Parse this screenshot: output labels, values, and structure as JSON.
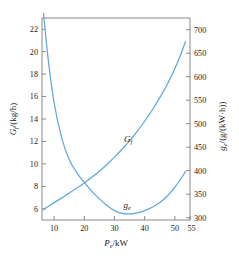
{
  "chart_data": {
    "type": "line",
    "title": "",
    "xlabel": "Pe /kW",
    "xlabel_main": "P",
    "xlabel_sub": "e",
    "xlabel_unit": "/kW",
    "ylabel_left": "Gf /(kg/h)",
    "ylabel_left_main": "G",
    "ylabel_left_sub": "f",
    "ylabel_left_unit": "/(kg/h)",
    "ylabel_right": "ge /(g/(kW·h))",
    "ylabel_right_main": "g",
    "ylabel_right_sub": "e",
    "ylabel_right_unit": "/(g/(kW·h))",
    "xlim": [
      6,
      55
    ],
    "xticks": [
      10,
      20,
      30,
      40,
      50,
      55
    ],
    "xtick_labels": [
      "10",
      "20",
      "30",
      "40",
      "50",
      "55"
    ],
    "ylim_left": [
      5,
      23
    ],
    "yticks_left": [
      6,
      8,
      10,
      12,
      14,
      16,
      18,
      20,
      22
    ],
    "ytick_labels_left": [
      "6",
      "8",
      "10",
      "12",
      "14",
      "16",
      "18",
      "20",
      "22"
    ],
    "ylim_right": [
      295,
      725
    ],
    "yticks_right": [
      300,
      350,
      400,
      450,
      500,
      550,
      600,
      650,
      700
    ],
    "ytick_labels_right": [
      "300",
      "350",
      "400",
      "450",
      "500",
      "550",
      "600",
      "650",
      "700"
    ],
    "grid": false,
    "legend_position": "inline-annotations",
    "curve_color": "#5FA8DC",
    "axis_color": "#7d7d7d",
    "series": [
      {
        "name": "Gf",
        "label": "G",
        "label_sub": "f",
        "axis": "left",
        "units": "kg/h",
        "x": [
          6.5,
          8,
          10,
          12.5,
          15,
          17.5,
          20,
          22.5,
          25,
          27.5,
          30,
          32.5,
          35,
          37.5,
          40,
          42.5,
          45,
          47.5,
          50,
          52,
          53.5
        ],
        "values": [
          5.95,
          6.2,
          6.55,
          6.95,
          7.4,
          7.85,
          8.3,
          8.8,
          9.35,
          9.95,
          10.6,
          11.3,
          12.05,
          12.9,
          13.8,
          14.8,
          15.9,
          17.1,
          18.5,
          19.8,
          20.9
        ]
      },
      {
        "name": "ge",
        "label": "g",
        "label_sub": "e",
        "axis": "right",
        "units": "g/(kW·h)",
        "x": [
          6.5,
          8,
          10,
          12.5,
          15,
          17.5,
          20,
          22.5,
          25,
          27.5,
          30,
          32.5,
          35,
          37.5,
          40,
          42.5,
          45,
          47.5,
          50,
          52,
          53.5
        ],
        "values": [
          735,
          640,
          545,
          470,
          424,
          396,
          375,
          356,
          340,
          326,
          315,
          309,
          308,
          310,
          315,
          322,
          332,
          346,
          365,
          383,
          398
        ]
      }
    ],
    "annotations": [
      {
        "name": "Gf",
        "text": "G",
        "sub": "f",
        "x": 36,
        "y_left": 12.3
      },
      {
        "name": "ge",
        "text": "g",
        "sub": "e",
        "x": 36.5,
        "y_right": 345
      }
    ]
  }
}
